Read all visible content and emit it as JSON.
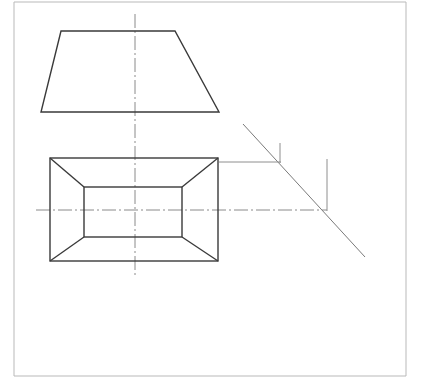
{
  "sheet": {
    "title": "Orthographic projection of a truncated pyramid (frustum)",
    "background_color": "#ffffff",
    "width": 421,
    "height": 386,
    "border": {
      "name": "sheet-border",
      "color": "#b9b9b9",
      "stroke_width": 1,
      "left_x": 14,
      "right_x": 406,
      "top_y": 2,
      "bottom_y": 376
    }
  },
  "line_styles": {
    "object_line": {
      "color": "#3a3a3a",
      "width": 1.4
    },
    "construction_line": {
      "color": "#7a7a7a",
      "width": 1.0
    },
    "center_line": {
      "color": "#8a8a8a",
      "width": 1.0,
      "dash": "14,3,2,3"
    },
    "projection_line": {
      "color": "#8e8e8e",
      "width": 1.0
    }
  },
  "views": {
    "front_view": {
      "name": "front-view-trapezoid",
      "label": "Front elevation — trapezoid outline",
      "points": [
        {
          "x": 61,
          "y": 31
        },
        {
          "x": 175,
          "y": 31
        },
        {
          "x": 219,
          "y": 112
        },
        {
          "x": 41,
          "y": 112
        }
      ]
    },
    "top_view": {
      "name": "top-view-plan",
      "label": "Top plan — rectangle with inner rectangle and corner diagonals",
      "outer_rect": {
        "x1": 50,
        "y1": 158,
        "x2": 218,
        "y2": 261
      },
      "inner_rect": {
        "x1": 84,
        "y1": 187,
        "x2": 182,
        "y2": 237
      },
      "diagonals": [
        {
          "x1": 50,
          "y1": 158,
          "x2": 84,
          "y2": 187
        },
        {
          "x1": 218,
          "y1": 158,
          "x2": 182,
          "y2": 187
        },
        {
          "x1": 218,
          "y1": 261,
          "x2": 182,
          "y2": 237
        },
        {
          "x1": 50,
          "y1": 261,
          "x2": 84,
          "y2": 237
        }
      ]
    }
  },
  "center_lines": {
    "vertical": {
      "name": "vertical-center-line",
      "x": 135,
      "y1": 14,
      "y2": 278
    },
    "horizontal": {
      "name": "horizontal-center-line",
      "y": 210,
      "x1": 36,
      "x2": 327
    }
  },
  "construction": {
    "miter_line": {
      "name": "miter-diagonal-line",
      "x1": 243,
      "y1": 124,
      "x2": 365,
      "y2": 257
    },
    "projection_lines": [
      {
        "name": "projector-upper-horizontal",
        "x1": 219,
        "y1": 162,
        "x2": 281,
        "y2": 162
      },
      {
        "name": "projector-upper-vertical-tick",
        "x1": 280,
        "y1": 143,
        "x2": 280,
        "y2": 163
      },
      {
        "name": "projector-lower-vertical",
        "x1": 327,
        "y1": 159,
        "x2": 327,
        "y2": 211
      }
    ]
  }
}
